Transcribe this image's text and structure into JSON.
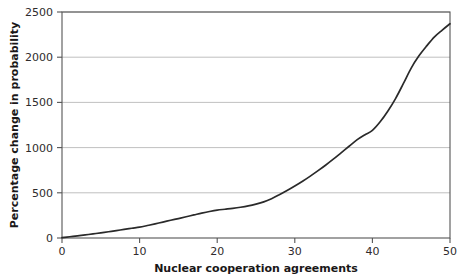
{
  "chart_data": {
    "type": "line",
    "title": "",
    "subtitle": "",
    "xlabel": "Nuclear cooperation agreements",
    "ylabel": "Percentage change in probability",
    "xlim": [
      0,
      50
    ],
    "ylim": [
      0,
      2500
    ],
    "xticks": [
      0,
      10,
      20,
      30,
      40,
      50
    ],
    "yticks": [
      0,
      500,
      1000,
      1500,
      2000,
      2500
    ],
    "xtick_labels": [
      "0",
      "10",
      "20",
      "30",
      "40",
      "50"
    ],
    "ytick_labels": [
      "0",
      "500",
      "1000",
      "1500",
      "2000",
      "2500"
    ],
    "grid": "horizontal",
    "legend": "none",
    "annotations": [],
    "line_color": "#2a2a2a",
    "grid_color": "#b9b9b9",
    "frame_color": "#555555",
    "background": "#ffffff",
    "series": [
      {
        "name": "Percentage change in probability",
        "x": [
          0,
          1,
          2,
          3,
          4,
          5,
          6,
          7,
          8,
          9,
          10,
          11,
          12,
          13,
          14,
          15,
          16,
          17,
          18,
          19,
          20,
          21,
          22,
          23,
          24,
          25,
          26,
          27,
          28,
          29,
          30,
          31,
          32,
          33,
          34,
          35,
          36,
          37,
          38,
          39,
          40,
          41,
          42,
          43,
          44,
          45,
          46,
          47,
          48,
          49,
          50
        ],
        "values": [
          5,
          14,
          24,
          34,
          45,
          57,
          69,
          82,
          95,
          108,
          120,
          138,
          157,
          176,
          196,
          215,
          235,
          255,
          275,
          293,
          308,
          318,
          328,
          340,
          355,
          375,
          400,
          435,
          478,
          525,
          575,
          628,
          685,
          745,
          808,
          875,
          945,
          1015,
          1085,
          1140,
          1190,
          1285,
          1405,
          1545,
          1710,
          1880,
          2015,
          2125,
          2225,
          2300,
          2370
        ]
      }
    ]
  }
}
